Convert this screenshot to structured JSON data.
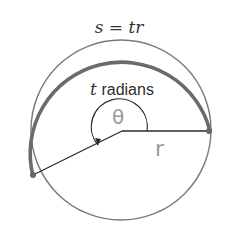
{
  "diagram": {
    "arc_length_label": "s = tr",
    "angle_label_var": "t",
    "angle_label_unit": " radians",
    "theta_label": "θ",
    "radius_label": "r",
    "colors": {
      "thick_arc": "#6b6b6b",
      "circle": "#7a7a7a",
      "radius_line": "#2a2a2a",
      "handwriting": "#9a9a9a",
      "text": "#333333"
    },
    "geometry": {
      "center": [
        122,
        131
      ],
      "radius": 89,
      "start_point": [
        208,
        132
      ],
      "end_point": [
        32,
        175
      ]
    }
  }
}
